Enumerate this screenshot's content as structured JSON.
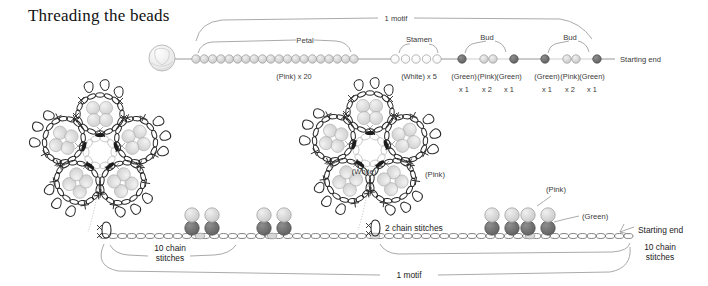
{
  "title": "Threading the beads",
  "top_diagram": {
    "motif_label": "1 motif",
    "starting_end_label": "Starting end",
    "groups": [
      {
        "name": "petal",
        "bracket_label": "Petal",
        "count_label": "(Pink) x 20",
        "bead_count": 20,
        "bead_color": "#d9d9d9",
        "x": 196,
        "width": 158
      },
      {
        "name": "stamen",
        "bracket_label": "Stamen",
        "count_label": "(White) x 5",
        "bead_count": 5,
        "bead_color": "#ffffff",
        "x": 395,
        "width": 42
      },
      {
        "name": "bud-1",
        "bracket_label": "Bud",
        "bead_count": 4,
        "x": 460,
        "width": 52
      },
      {
        "name": "bud-2",
        "bracket_label": "Bud",
        "bead_count": 4,
        "x": 542,
        "width": 52
      }
    ],
    "bud_sublabels": [
      {
        "color": "(Green)",
        "qty": "x 1"
      },
      {
        "color": "(Pink)",
        "qty": "x 2"
      },
      {
        "color": "(Green)",
        "qty": "x 1"
      },
      {
        "color": "(Green)",
        "qty": "x 1"
      },
      {
        "color": "(Pink)",
        "qty": "x 2"
      },
      {
        "color": "(Green)",
        "qty": "x 1"
      }
    ]
  },
  "bottom_diagram": {
    "motif_label": "1 motif",
    "starting_end_label": "Starting end",
    "two_chain_label": "2 chain stitches",
    "ten_chain_label_line1": "10 chain",
    "ten_chain_label_line2": "stitches",
    "center_label": "(White)",
    "petal_label": "(Pink)",
    "bead_pink_label": "(Pink)",
    "bead_green_label": "(Green)"
  },
  "colors": {
    "bead_pink": "#d0d0d0",
    "bead_green": "#6e6e6e",
    "bead_white": "#ffffff",
    "thread": "#8a8a8a",
    "ink": "#2a2a2a",
    "label": "#3a3a3a",
    "background": "#ffffff"
  }
}
